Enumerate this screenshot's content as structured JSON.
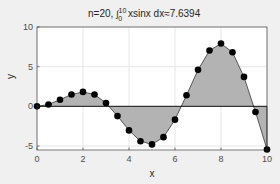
{
  "chart_data": {
    "type": "area",
    "title_parts": {
      "prefix": "n=20,  ",
      "integral": "∫",
      "upper": "10",
      "lower": "0",
      "suffix": " xsinx dx≈7.6394"
    },
    "xlabel": "x",
    "ylabel": "y",
    "xlim": [
      0,
      10
    ],
    "ylim": [
      -5.5,
      10
    ],
    "xticks": [
      0,
      2,
      4,
      6,
      8,
      10
    ],
    "yticks": [
      -5,
      0,
      5,
      10
    ],
    "grid": true,
    "series": [
      {
        "name": "x*sin(x) samples",
        "x": [
          0,
          0.5,
          1,
          1.5,
          2,
          2.5,
          3,
          3.5,
          4,
          4.5,
          5,
          5.5,
          6,
          6.5,
          7,
          7.5,
          8,
          8.5,
          9,
          9.5,
          10
        ],
        "values": [
          0,
          0.2397,
          0.8415,
          1.4962,
          1.8186,
          1.4962,
          0.4234,
          -1.2277,
          -3.0272,
          -4.3988,
          -4.7946,
          -3.8808,
          -1.6765,
          1.4017,
          4.5989,
          7.035,
          7.9149,
          6.8252,
          3.7091,
          -0.7151,
          -5.4402
        ],
        "fill_color": "#b3b3b3",
        "marker_color": "#000000"
      }
    ]
  }
}
